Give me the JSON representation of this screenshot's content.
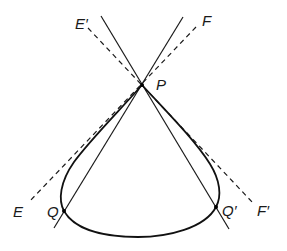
{
  "diagram": {
    "type": "geometric-curve-tangents",
    "labels": {
      "E_prime": "E′",
      "F": "F",
      "P": "P",
      "E": "E",
      "Q": "Q",
      "Q_prime": "Q′",
      "F_prime": "F′"
    },
    "points": {
      "P": [
        142,
        85
      ],
      "Q": [
        64,
        211
      ],
      "Q_prime": [
        216,
        207
      ]
    },
    "lines": [
      {
        "name": "solid-line-1",
        "style": "solid",
        "from": [
          101,
          16
        ],
        "to": [
          229,
          229
        ]
      },
      {
        "name": "solid-line-2",
        "style": "solid",
        "from": [
          183,
          17
        ],
        "to": [
          54,
          228
        ]
      },
      {
        "name": "tangent-E-prime-F-prime",
        "style": "dashed",
        "from": "E′",
        "to": "F′"
      },
      {
        "name": "tangent-E-F",
        "style": "dashed",
        "from": "E",
        "to": "F"
      }
    ],
    "colors": {
      "stroke": "#1a1a1a",
      "background": "#ffffff"
    }
  }
}
